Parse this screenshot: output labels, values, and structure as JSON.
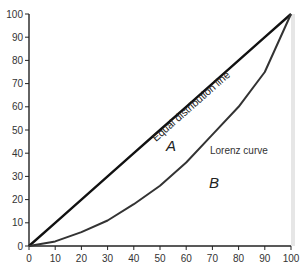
{
  "chart_data": {
    "type": "line",
    "title": "",
    "xlabel": "",
    "ylabel": "",
    "xlim": [
      0,
      100
    ],
    "ylim": [
      0,
      100
    ],
    "x_ticks": [
      0,
      10,
      20,
      30,
      40,
      50,
      60,
      70,
      80,
      90,
      100
    ],
    "y_ticks": [
      0,
      10,
      20,
      30,
      40,
      50,
      60,
      70,
      80,
      90,
      100
    ],
    "grid": false,
    "legend": null,
    "x": [
      0,
      10,
      20,
      30,
      40,
      50,
      60,
      70,
      80,
      90,
      100
    ],
    "series": [
      {
        "name": "Equal distribution line",
        "values": [
          0,
          10,
          20,
          30,
          40,
          50,
          60,
          70,
          80,
          90,
          100
        ],
        "color": "#111111"
      },
      {
        "name": "Lorenz curve",
        "values": [
          0,
          2,
          6,
          11,
          18,
          26,
          36,
          48,
          60,
          75,
          100
        ],
        "color": "#333333"
      }
    ],
    "annotations": [
      {
        "text": "Equal distribution line",
        "x": 50,
        "y": 55,
        "rotation": -41
      },
      {
        "text": "Lorenz curve",
        "x": 78,
        "y": 53
      },
      {
        "text": "A",
        "x": 56,
        "y": 43,
        "italic": true
      },
      {
        "text": "B",
        "x": 65,
        "y": 27,
        "italic": true
      }
    ]
  },
  "labels": {
    "equal_line": "Equal distribution line",
    "lorenz": "Lorenz curve",
    "area_a": "A",
    "area_b": "B"
  },
  "colors": {
    "axis": "#222222",
    "equal_line": "#111111",
    "lorenz": "#333333",
    "frame": "#dddddd",
    "text": "#333333"
  }
}
